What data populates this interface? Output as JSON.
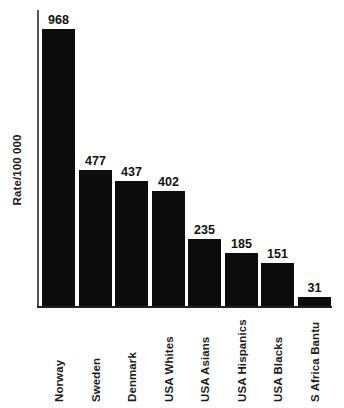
{
  "chart_data": {
    "type": "bar",
    "title": "",
    "subtitle": "",
    "xlabel": "",
    "ylabel": "Rate/100 000",
    "categories": [
      "Norway",
      "Sweden",
      "Denmark",
      "USA Whites",
      "USA Asians",
      "USA Hispanics",
      "USA Blacks",
      "S Africa Bantu"
    ],
    "values": [
      968,
      477,
      437,
      402,
      235,
      185,
      151,
      31
    ],
    "value_labels": [
      "968",
      "477",
      "437",
      "402",
      "235",
      "185",
      "151",
      "31"
    ],
    "ylim": [
      0,
      1035
    ],
    "grid": false,
    "legend": null,
    "bar_color": "#0c0c0c",
    "axis_color": "#222222",
    "background_color": "#ffffff",
    "tick_labels_y": [],
    "annotations": []
  }
}
